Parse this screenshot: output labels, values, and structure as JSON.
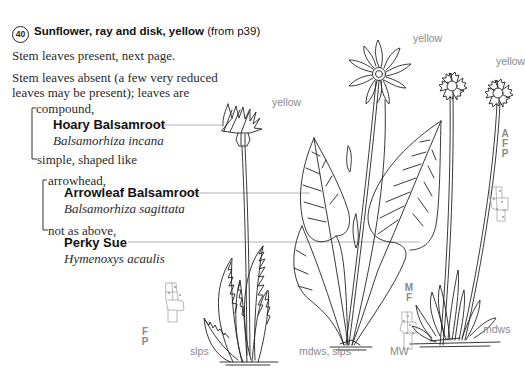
{
  "key": {
    "number": "40",
    "title": "Sunflower, ray and disk, yellow",
    "from": "(from p39)"
  },
  "couplets": {
    "stem_present": "Stem leaves present, next page.",
    "stem_absent_1": "Stem leaves absent (a few very reduced",
    "stem_absent_2": "leaves may be present); leaves are",
    "compound": "compound,",
    "simple": "simple, shaped like",
    "arrowhead": "arrowhead,",
    "not_as_above": "not as above,"
  },
  "species": [
    {
      "common_name": "Hoary Balsamroot",
      "scientific_name": "Balsamorhiza incana",
      "flower_color": "yellow",
      "habitat": "slps",
      "codes": [
        "F",
        "P"
      ]
    },
    {
      "common_name": "Arrowleaf Balsamroot",
      "scientific_name": "Balsamorhiza sagittata",
      "flower_color": "yellow",
      "habitat": "mdws, slps",
      "codes": [
        "M",
        "F"
      ],
      "extra_code": "MW"
    },
    {
      "common_name": "Perky Sue",
      "scientific_name": "Hymenoxys acaulis",
      "flower_color": "yellow",
      "habitat": "mdws",
      "codes": [
        "A",
        "F",
        "P"
      ]
    }
  ],
  "colors": {
    "text": "#2a2a2a",
    "label_gray": "#8a8a8a",
    "line": "#222222",
    "leader": "#9a9a9a"
  }
}
